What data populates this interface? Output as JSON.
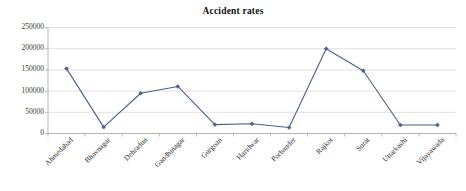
{
  "chart_data": {
    "type": "line",
    "title": "Accident rates",
    "xlabel": "",
    "ylabel": "",
    "categories": [
      "Ahmedabad",
      "Bhavnagar",
      "Dehradun",
      "Gandhinagar",
      "Gurgoan",
      "Haridwar",
      "Porbander",
      "Rajkot",
      "Surat",
      "Uttarkashi",
      "Vijayawada"
    ],
    "values": [
      153000,
      15000,
      95000,
      111000,
      21000,
      23000,
      14000,
      200000,
      148000,
      20000,
      20000
    ],
    "series": [
      {
        "name": "Accident rates",
        "values": [
          153000,
          15000,
          95000,
          111000,
          21000,
          23000,
          14000,
          200000,
          148000,
          20000,
          20000
        ],
        "color": "#4a5f8e",
        "marker": "diamond"
      }
    ],
    "ylim": [
      0,
      250000
    ],
    "yticks": [
      0,
      50000,
      100000,
      150000,
      200000,
      250000
    ],
    "ytick_labels": [
      "0",
      "50000",
      "100000",
      "150000",
      "200000",
      "250000"
    ],
    "grid": "horizontal",
    "legend": "none",
    "xlabel_rotation": -45
  },
  "colors": {
    "series_line": "#4a5f8e",
    "gridline": "#d9d9d9",
    "axis": "#b0b0b0",
    "text": "#2e2e2e",
    "background": "#ffffff"
  }
}
